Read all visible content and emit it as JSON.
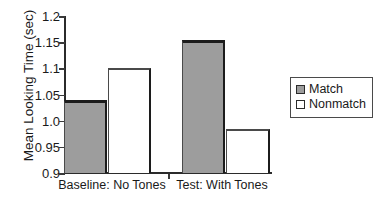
{
  "chart_data": {
    "type": "bar",
    "title": "",
    "xlabel": "",
    "ylabel": "Mean Looking Time (sec)",
    "categories": [
      "Baseline: No Tones",
      "Test: With Tones"
    ],
    "series": [
      {
        "name": "Match",
        "values": [
          1.04,
          1.155
        ]
      },
      {
        "name": "Nonmatch",
        "values": [
          1.1,
          0.985
        ]
      }
    ],
    "ylim": [
      0.9,
      1.2
    ],
    "ytick_values": [
      0.9,
      0.95,
      1.0,
      1.05,
      1.1,
      1.15,
      1.2
    ],
    "ytick_labels": [
      "0.9",
      "0.95",
      "1.0",
      "1.05",
      "1.1",
      "1.15",
      "1.2"
    ],
    "grid": false,
    "legend_position": "right",
    "legend": [
      {
        "label": "Match",
        "swatch": "filled",
        "color": "#9d9d9d"
      },
      {
        "label": "Nonmatch",
        "swatch": "empty",
        "color": "#ffffff"
      }
    ]
  },
  "axis": {
    "y_title": "Mean Looking Time (sec)"
  },
  "colors": {
    "match_fill": "#9d9d9d",
    "nonmatch_fill": "#ffffff",
    "outline": "#1c1c1c",
    "axis": "#2b2b2b",
    "text": "#1a1a1a"
  }
}
